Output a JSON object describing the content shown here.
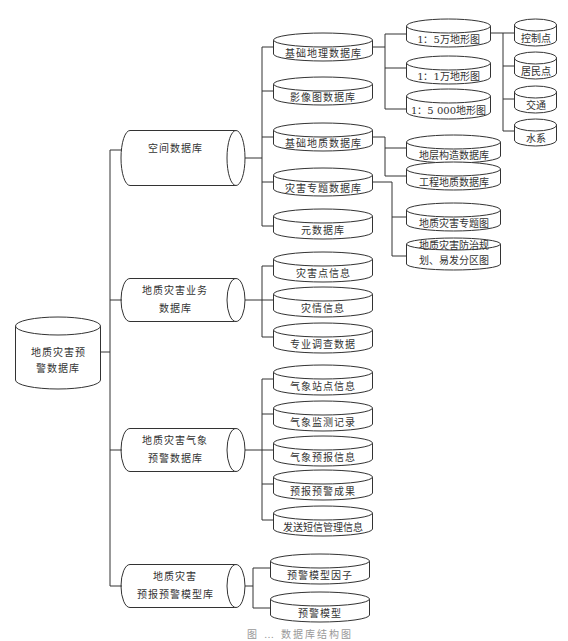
{
  "root": {
    "label_line1": "地质灾害预",
    "label_line2": "警数据库"
  },
  "level1": [
    {
      "label_line1": "空间数据库",
      "label_line2": ""
    },
    {
      "label_line1": "地质灾害业务",
      "label_line2": "数据库"
    },
    {
      "label_line1": "地质灾害气象",
      "label_line2": "预警数据库"
    },
    {
      "label_line1": "地质灾害",
      "label_line2": "预报预警模型库"
    }
  ],
  "spatial_children": [
    "基础地理数据库",
    "影像图数据库",
    "基础地质数据库",
    "灾害专题数据库",
    "元数据库"
  ],
  "basic_geo_children": [
    "1：5万地形图",
    "1：1万地形图",
    "1：5 000地形图"
  ],
  "topo_children": [
    "控制点",
    "居民点",
    "交通",
    "水系"
  ],
  "basic_geology_children": [
    "地层构造数据库",
    "工程地质数据库"
  ],
  "hazard_thematic_children": [
    {
      "line1": "地质灾害专题图",
      "line2": ""
    },
    {
      "line1": "地质灾害防治规",
      "line2": "划、易发分区图"
    }
  ],
  "business_children": [
    "灾害点信息",
    "灾情信息",
    "专业调查数据"
  ],
  "meteo_children": [
    "气象站点信息",
    "气象监测记录",
    "气象预报信息",
    "预报预警成果",
    "发送短信管理信息"
  ],
  "model_children": [
    "预警模型因子",
    "预警模型"
  ],
  "caption": "图 … 数据库结构图"
}
